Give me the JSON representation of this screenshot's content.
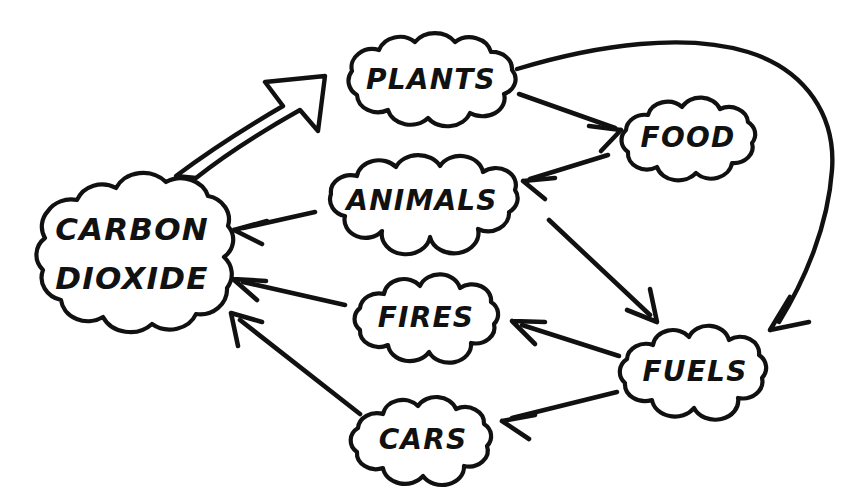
{
  "diagram": {
    "background_color": "#ffffff",
    "ink_color": "#111111",
    "style": "hand-drawn thought-cloud concept map",
    "nodes": [
      {
        "id": "carbon-dioxide",
        "label_line1": "CARBON",
        "label_line2": "DIOXIDE",
        "label": "CARBON DIOXIDE",
        "cx": 131,
        "cy": 254,
        "rx": 104,
        "ry": 70,
        "font_size": 31,
        "two_line": true
      },
      {
        "id": "plants",
        "label": "PLANTS",
        "cx": 430,
        "cy": 79,
        "rx": 86,
        "ry": 42,
        "font_size": 28,
        "two_line": false
      },
      {
        "id": "food",
        "label": "FOOD",
        "cx": 687,
        "cy": 138,
        "rx": 68,
        "ry": 37,
        "font_size": 28,
        "two_line": false
      },
      {
        "id": "animals",
        "label": "ANIMALS",
        "cx": 421,
        "cy": 200,
        "rx": 97,
        "ry": 39,
        "font_size": 28,
        "two_line": false
      },
      {
        "id": "fires",
        "label": "FIRES",
        "cx": 425,
        "cy": 318,
        "rx": 74,
        "ry": 36,
        "font_size": 28,
        "two_line": false
      },
      {
        "id": "fuels",
        "label": "FUELS",
        "cx": 694,
        "cy": 371,
        "rx": 75,
        "ry": 39,
        "font_size": 28,
        "two_line": false
      },
      {
        "id": "cars",
        "label": "CARS",
        "cx": 422,
        "cy": 439,
        "rx": 68,
        "ry": 39,
        "font_size": 28,
        "two_line": false
      }
    ],
    "edges": [
      {
        "id": "co2-to-plants",
        "from": "carbon-dioxide",
        "to": "plants",
        "style": "thick-outline-block-arrow",
        "description": "hollow block arrow curving up from carbon dioxide to plants"
      },
      {
        "id": "plants-to-fuels",
        "from": "plants",
        "to": "fuels",
        "style": "long-curved-arrow",
        "description": "long curve sweeping over the top right down into fuels"
      },
      {
        "id": "plants-to-food",
        "from": "plants",
        "to": "food",
        "style": "straight-arrow",
        "description": "short arrow from plants down-right to food"
      },
      {
        "id": "food-to-animals",
        "from": "food",
        "to": "animals",
        "style": "straight-arrow",
        "description": "arrow from food left to animals"
      },
      {
        "id": "animals-to-co2",
        "from": "animals",
        "to": "carbon-dioxide",
        "style": "straight-arrow",
        "description": "arrow from animals left to carbon dioxide"
      },
      {
        "id": "animals-to-fuels",
        "from": "animals",
        "to": "fuels",
        "style": "straight-arrow",
        "description": "long diagonal arrow from animals down-right to fuels"
      },
      {
        "id": "fuels-to-fires",
        "from": "fuels",
        "to": "fires",
        "style": "straight-arrow",
        "description": "arrow from fuels up-left to fires"
      },
      {
        "id": "fuels-to-cars",
        "from": "fuels",
        "to": "cars",
        "style": "straight-arrow",
        "description": "arrow from fuels down-left to cars"
      },
      {
        "id": "fires-to-co2",
        "from": "fires",
        "to": "carbon-dioxide",
        "style": "straight-arrow",
        "description": "arrow from fires left to carbon dioxide"
      },
      {
        "id": "cars-to-co2",
        "from": "cars",
        "to": "carbon-dioxide",
        "style": "straight-arrow",
        "description": "arrow from cars up-left to carbon dioxide"
      }
    ]
  }
}
